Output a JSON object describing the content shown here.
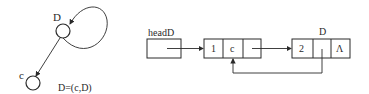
{
  "graph": {
    "node_top_label": "D",
    "node_bottom_label": "c",
    "equation": "D=(c,D)"
  },
  "list": {
    "head_label": "headD",
    "node1": {
      "tag": "1",
      "atom": "c"
    },
    "node2_label": "D",
    "node2": {
      "tag": "2",
      "null_symbol": "Λ"
    }
  },
  "colors": {
    "stroke": "#2a2a2a",
    "background": "#ffffff"
  }
}
